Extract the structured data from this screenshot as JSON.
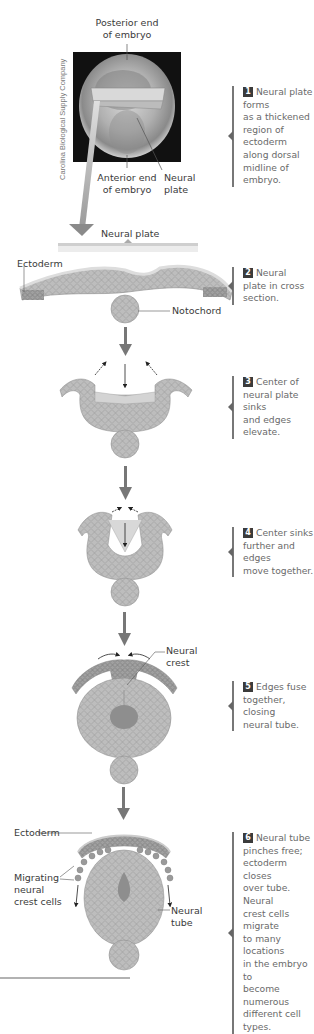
{
  "photo": {
    "credit": "Carolina Biological Supply Company",
    "labels": {
      "posterior": [
        "Posterior end",
        "of embryo"
      ],
      "anterior": [
        "Anterior end",
        "of embryo"
      ],
      "neural_plate": [
        "Neural",
        "plate"
      ]
    }
  },
  "section_labels": {
    "neural_plate_header": "Neural plate",
    "ectoderm_top": "Ectoderm",
    "notochord": "Notochord",
    "neural_crest": [
      "Neural",
      "crest"
    ],
    "ectoderm_bottom": "Ectoderm",
    "migrating": [
      "Migrating",
      "neural",
      "crest cells"
    ],
    "neural_tube": [
      "Neural",
      "tube"
    ]
  },
  "steps": [
    {
      "number": "1",
      "lines": [
        "Neural plate forms",
        "as a thickened region of",
        "ectoderm along dorsal",
        "midline of embryo."
      ]
    },
    {
      "number": "2",
      "lines": [
        "Neural",
        "plate in cross",
        "section."
      ]
    },
    {
      "number": "3",
      "lines": [
        "Center of",
        "neural plate sinks",
        "and edges elevate."
      ]
    },
    {
      "number": "4",
      "lines": [
        "Center sinks",
        "further and edges",
        "move together."
      ]
    },
    {
      "number": "5",
      "lines": [
        "Edges fuse",
        "together, closing",
        "neural tube."
      ]
    },
    {
      "number": "6",
      "lines": [
        "Neural tube",
        "pinches free;",
        "ectoderm closes",
        "over tube. Neural",
        "crest cells migrate",
        "to many locations",
        "in the embryo to",
        "become numerous",
        "different cell types."
      ]
    }
  ],
  "colors": {
    "tissue": "#b8b8b8",
    "tissue_dark": "#8e8e8e",
    "arrow": "#7a7a7a",
    "badge": "#3b3b3b",
    "text": "#3a3a3a",
    "step_text": "#6a6a6a"
  }
}
